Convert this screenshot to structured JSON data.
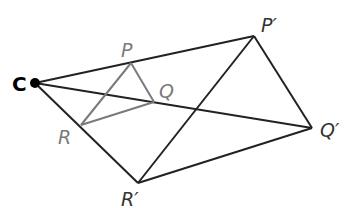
{
  "diagram": {
    "colors": {
      "background": "#ffffff",
      "original": "#7a7a7a",
      "image": "#222222",
      "center": "#000000"
    },
    "center": {
      "label": "C",
      "x": 35,
      "y": 83
    },
    "original_triangle": {
      "vertices": [
        {
          "label": "P",
          "x": 131,
          "y": 63
        },
        {
          "label": "Q",
          "x": 154,
          "y": 102
        },
        {
          "label": "R",
          "x": 81,
          "y": 125
        }
      ]
    },
    "image_triangle": {
      "vertices": [
        {
          "label": "P′",
          "x": 254,
          "y": 36
        },
        {
          "label": "Q′",
          "x": 312,
          "y": 128
        },
        {
          "label": "R′",
          "x": 138,
          "y": 183
        }
      ]
    },
    "labels": {
      "C": "C",
      "P": "P",
      "Q": "Q",
      "R": "R",
      "P_prime": "P′",
      "Q_prime": "Q′",
      "R_prime": "R′"
    }
  }
}
